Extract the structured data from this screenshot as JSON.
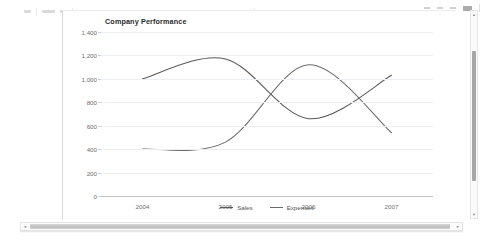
{
  "window": {
    "toolbar_controls": [
      "minimize",
      "restore",
      "close"
    ]
  },
  "scrollbars": {
    "vertical": {
      "up_arrow": "▲",
      "down_arrow": "▼"
    },
    "horizontal": {
      "left_arrow": "◄",
      "right_arrow": "►"
    }
  },
  "chart_data": {
    "type": "line",
    "title": "Company Performance",
    "xlabel": "",
    "ylabel": "",
    "categories": [
      "2004",
      "2005",
      "2006",
      "2007"
    ],
    "series": [
      {
        "name": "Sales",
        "values": [
          1000,
          1170,
          660,
          1030
        ],
        "color": "#595959"
      },
      {
        "name": "Expenses",
        "values": [
          400,
          460,
          1120,
          540
        ],
        "color": "#6b6b6b"
      }
    ],
    "yticks": [
      "0",
      "200",
      "400",
      "600",
      "800",
      "1,000",
      "1,200",
      "1,400"
    ],
    "ytick_values": [
      0,
      200,
      400,
      600,
      800,
      1000,
      1200,
      1400
    ],
    "ylim": [
      0,
      1400
    ],
    "grid": true,
    "smoothing": "spline",
    "legend_position": "bottom"
  }
}
